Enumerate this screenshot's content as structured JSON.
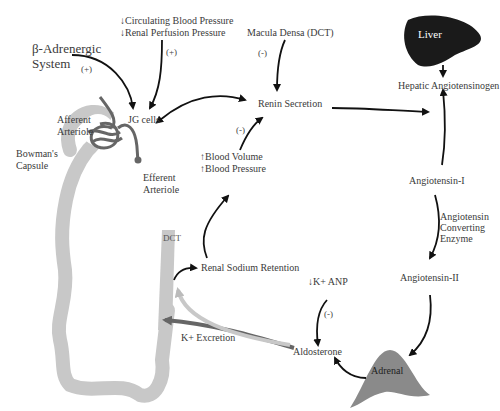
{
  "diagram": {
    "nodes": {
      "beta_adrenergic": {
        "line1": "β-Adrenergic",
        "line2": "System"
      },
      "circ_bp": "↓Circulating Blood Pressure",
      "renal_perf": "↓Renal Perfusion Pressure",
      "macula_densa": "Macula Densa (DCT)",
      "liver": "Liver",
      "hepatic_angiotensinogen": "Hepatic Angiotensinogen",
      "jg_cells": "JG cells",
      "renin_secretion": "Renin Secretion",
      "blood_volume": "↑Blood Volume",
      "blood_pressure": "↑Blood Pressure",
      "angiotensin_1": "Angiotensin-I",
      "ace": {
        "line1": "Angiotensin",
        "line2": "Converting",
        "line3": "Enzyme"
      },
      "angiotensin_2": "Angiotensin-II",
      "renal_sodium": "Renal Sodium Retention",
      "k_anp": "↓K+ ANP",
      "k_excretion": "K+ Excretion",
      "aldosterone": "Aldosterone",
      "adrenal": "Adrenal",
      "dct": "DCT"
    },
    "anatomy_labels": {
      "afferent": {
        "line1": "Afferent",
        "line2": "Arteriole"
      },
      "bowmans": {
        "line1": "Bowman's",
        "line2": "Capsule"
      },
      "efferent": {
        "line1": "Efferent",
        "line2": "Arteriole"
      }
    },
    "signs": {
      "beta_plus": "(+)",
      "pressure_plus": "(+)",
      "macula_minus": "(-)",
      "volume_minus": "(-)",
      "anp_minus": "(-)"
    },
    "colors": {
      "arrow": "#111111",
      "tubule": "#c8c8c8",
      "vessel": "#666666",
      "liver": "#1a1a1a",
      "adrenal": "#8a8a8a"
    }
  }
}
